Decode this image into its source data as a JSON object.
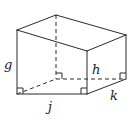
{
  "diagram": {
    "type": "rectangular-prism",
    "stroke_color": "#2a2a2a",
    "background": "#ffffff",
    "labels": {
      "g": "g",
      "h": "h",
      "j": "j",
      "k": "k"
    },
    "label_positions": {
      "g": {
        "x": 4,
        "y": 69
      },
      "h": {
        "x": 92,
        "y": 74
      },
      "j": {
        "x": 48,
        "y": 111
      },
      "k": {
        "x": 110,
        "y": 100
      }
    },
    "vertices": {
      "front_top_left": [
        17,
        30
      ],
      "front_top_right": [
        87,
        51
      ],
      "front_bottom_left": [
        17,
        94
      ],
      "front_bottom_right": [
        87,
        94
      ],
      "back_top_left": [
        56,
        15
      ],
      "back_top_right": [
        126,
        35
      ],
      "back_bottom_left": [
        56,
        79
      ],
      "back_bottom_right": [
        126,
        79
      ]
    },
    "right_angle_markers": [
      "front_bottom_left",
      "front_bottom_right",
      "back_bottom_left",
      "back_bottom_right"
    ]
  }
}
